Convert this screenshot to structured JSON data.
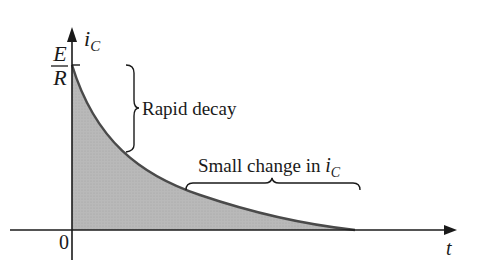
{
  "diagram": {
    "type": "exponential-decay-plot",
    "y_axis": {
      "label": "i",
      "label_subscript": "C"
    },
    "x_axis": {
      "label": "t"
    },
    "origin_label": "0",
    "initial_value": {
      "numerator": "E",
      "denominator": "R"
    },
    "annotations": [
      {
        "id": "rapid",
        "text": "Rapid decay"
      },
      {
        "id": "small",
        "text": "Small change in ",
        "var": "i",
        "var_subscript": "C"
      }
    ],
    "colors": {
      "fill": "#b4b4b4",
      "curve": "#4a4a4a",
      "axis": "#1a1a1a",
      "text": "#1a1a1a"
    }
  }
}
